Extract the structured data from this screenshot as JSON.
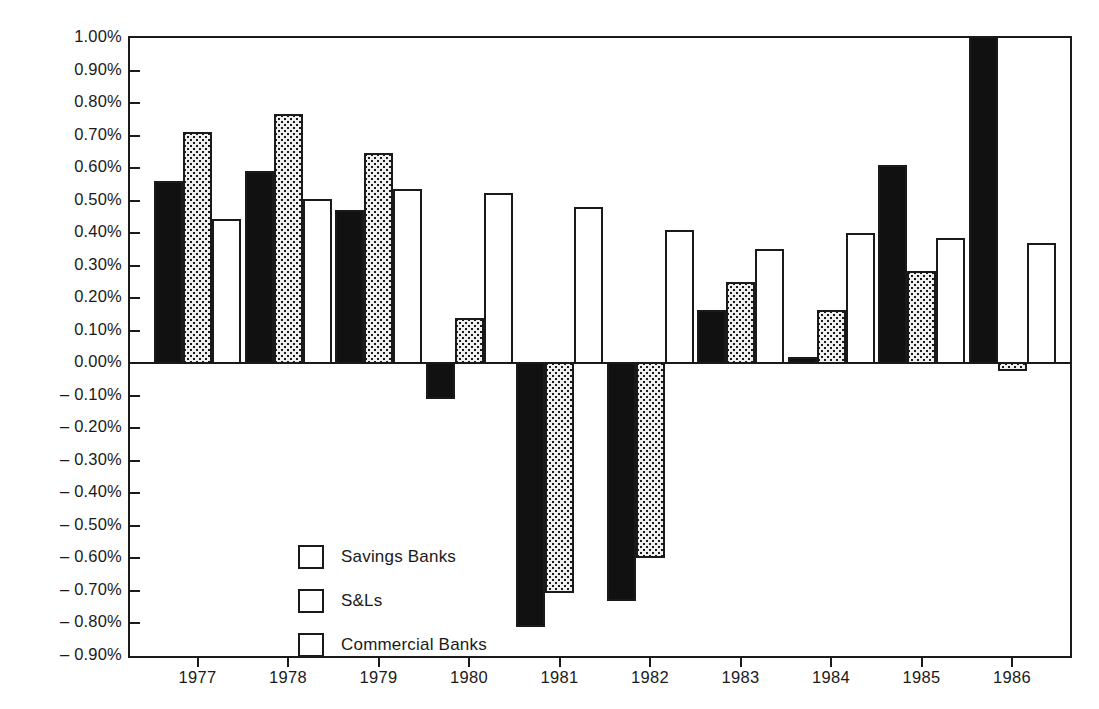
{
  "chart_data": {
    "type": "bar",
    "title": "",
    "subtitle": "",
    "xlabel": "",
    "ylabel": "",
    "categories": [
      "1977",
      "1978",
      "1979",
      "1980",
      "1981",
      "1982",
      "1983",
      "1984",
      "1985",
      "1986"
    ],
    "series": [
      {
        "name": "Savings Banks",
        "fill": "solid-black",
        "values": [
          0.56,
          0.59,
          0.47,
          -0.11,
          -0.81,
          -0.73,
          0.165,
          0.02,
          0.61,
          1.05
        ],
        "clipped": [
          false,
          false,
          false,
          false,
          false,
          false,
          false,
          false,
          false,
          true
        ]
      },
      {
        "name": "S&Ls",
        "fill": "dotted-gray",
        "values": [
          0.71,
          0.765,
          0.645,
          0.14,
          -0.705,
          -0.6,
          0.25,
          0.165,
          0.285,
          -0.025
        ],
        "clipped": [
          false,
          false,
          false,
          false,
          false,
          false,
          false,
          false,
          false,
          false
        ]
      },
      {
        "name": "Commercial Banks",
        "fill": "white-outline",
        "values": [
          0.445,
          0.505,
          0.535,
          0.525,
          0.48,
          0.41,
          0.35,
          0.4,
          0.385,
          0.37
        ],
        "clipped": [
          false,
          false,
          false,
          false,
          false,
          false,
          false,
          false,
          false,
          false
        ]
      }
    ],
    "ylim": [
      -0.9,
      1.0
    ],
    "ytick_values": [
      1.0,
      0.9,
      0.8,
      0.7,
      0.6,
      0.5,
      0.4,
      0.3,
      0.2,
      0.1,
      0.0,
      -0.1,
      -0.2,
      -0.3,
      -0.4,
      -0.5,
      -0.6,
      -0.7,
      -0.8,
      -0.9
    ],
    "ytick_labels": [
      "1.00%",
      "0.90%",
      "0.80%",
      "0.70%",
      "0.60%",
      "0.50%",
      "0.40%",
      "0.30%",
      "0.20%",
      "0.10%",
      "0.00%",
      "– 0.10%",
      "– 0.20%",
      "– 0.30%",
      "– 0.40%",
      "– 0.50%",
      "– 0.60%",
      "– 0.70%",
      "– 0.80%",
      "– 0.90%"
    ],
    "grid": false,
    "legend_position": "inside-lower-left",
    "value_unit": "percent",
    "note_clipped_bar": "1986 Savings Banks bar extends beyond the 1.00% top of the axis"
  },
  "legend": {
    "items": [
      {
        "label": "Savings Banks",
        "swatch": "solid-black"
      },
      {
        "label": "S&Ls",
        "swatch": "dotted-gray"
      },
      {
        "label": "Commercial Banks",
        "swatch": "white-outline"
      }
    ]
  },
  "axes": {
    "y": {
      "labels": [
        "1.00%",
        "0.90%",
        "0.80%",
        "0.70%",
        "0.60%",
        "0.50%",
        "0.40%",
        "0.30%",
        "0.20%",
        "0.10%",
        "0.00%",
        "– 0.10%",
        "– 0.20%",
        "– 0.30%",
        "– 0.40%",
        "– 0.50%",
        "– 0.60%",
        "– 0.70%",
        "– 0.80%",
        "– 0.90%"
      ]
    },
    "x": {
      "labels": [
        "1977",
        "1978",
        "1979",
        "1980",
        "1981",
        "1982",
        "1983",
        "1984",
        "1985",
        "1986"
      ]
    }
  },
  "colors": {
    "ink": "#1a1a1a",
    "savings_fill": "#111111",
    "snl_fill": "#efefef",
    "commercial_fill": "#ffffff",
    "background": "#ffffff"
  }
}
